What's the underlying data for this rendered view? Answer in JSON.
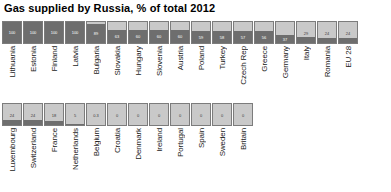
{
  "chart_data": {
    "type": "bar",
    "title": "Gas supplied by Russia, % of total 2012",
    "xlabel": "",
    "ylabel": "% of total",
    "ylim": [
      0,
      100
    ],
    "grid": false,
    "legend": "none",
    "orientation": "vertical-fill-box",
    "unit": "%",
    "rows": [
      {
        "name": "row-1",
        "points": [
          {
            "category": "Lithuania",
            "value": 100,
            "display": "100"
          },
          {
            "category": "Estonia",
            "value": 100,
            "display": "100"
          },
          {
            "category": "Finland",
            "value": 100,
            "display": "100"
          },
          {
            "category": "Latvia",
            "value": 100,
            "display": "100"
          },
          {
            "category": "Bulgaria",
            "value": 89,
            "display": "89"
          },
          {
            "category": "Slovakia",
            "value": 63,
            "display": "63"
          },
          {
            "category": "Hungary",
            "value": 60,
            "display": "60"
          },
          {
            "category": "Slovenia",
            "value": 60,
            "display": "60"
          },
          {
            "category": "Austria",
            "value": 60,
            "display": "60"
          },
          {
            "category": "Poland",
            "value": 59,
            "display": "59"
          },
          {
            "category": "Turkey",
            "value": 58,
            "display": "58"
          },
          {
            "category": "Czech Rep",
            "value": 57,
            "display": "57"
          },
          {
            "category": "Greece",
            "value": 56,
            "display": "56"
          },
          {
            "category": "Germany",
            "value": 37,
            "display": "37"
          },
          {
            "category": "Italy",
            "value": 29,
            "display": "29"
          },
          {
            "category": "Romania",
            "value": 24,
            "display": "24"
          },
          {
            "category": "EU 28",
            "value": 24,
            "display": "24"
          }
        ]
      },
      {
        "name": "row-2",
        "points": [
          {
            "category": "Luxembourg",
            "value": 24,
            "display": "24"
          },
          {
            "category": "Switzerland",
            "value": 24,
            "display": "24"
          },
          {
            "category": "France",
            "value": 18,
            "display": "18"
          },
          {
            "category": "Netherlands",
            "value": 5,
            "display": "5"
          },
          {
            "category": "Belgium",
            "value": 0.3,
            "display": "0.3"
          },
          {
            "category": "Croatia",
            "value": 0,
            "display": "0"
          },
          {
            "category": "Denmark",
            "value": 0,
            "display": "0"
          },
          {
            "category": "Ireland",
            "value": 0,
            "display": "0"
          },
          {
            "category": "Portugal",
            "value": 0,
            "display": "0"
          },
          {
            "category": "Spain",
            "value": 0,
            "display": "0"
          },
          {
            "category": "Sweden",
            "value": 0,
            "display": "0"
          },
          {
            "category": "Britain",
            "value": 0,
            "display": "0"
          }
        ]
      }
    ],
    "colors": {
      "fill": "#6e6e6e",
      "track": "#c9c9c9",
      "border": "#7c7c7c",
      "label": "#1a1a1a",
      "title": "#000000"
    }
  }
}
